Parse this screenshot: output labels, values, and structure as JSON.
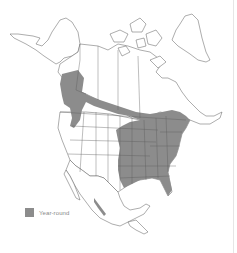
{
  "map": {
    "subject": "range map of North America",
    "colors": {
      "range_fill": "#8c8c8c",
      "outline": "#5a5a5a",
      "land": "#ffffff",
      "background": "#ffffff"
    }
  },
  "legend": {
    "items": [
      {
        "label": "Year-round",
        "color": "#8c8c8c"
      }
    ]
  }
}
